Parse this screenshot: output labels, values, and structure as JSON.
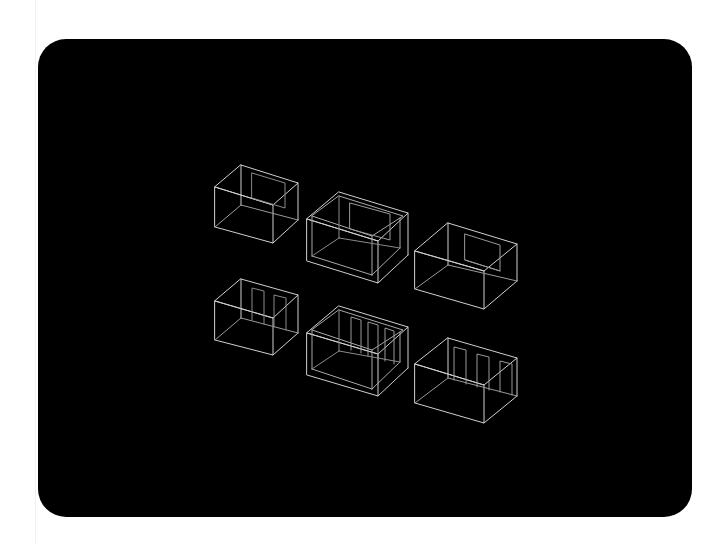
{
  "canvas": {
    "background": "#ffffff",
    "panel_color": "#000000",
    "line_color": "#cfcfcf",
    "dim_line_color": "#8a8a8a"
  },
  "scene": {
    "description": "Six isometric wireframe room boxes arranged in a 2x3 grid",
    "rows": [
      {
        "items": [
          {
            "name": "room-1",
            "openings": "single window on back wall",
            "walls": "single"
          },
          {
            "name": "room-2",
            "openings": "single window on back wall",
            "walls": "double"
          },
          {
            "name": "room-3",
            "openings": "single window on back wall",
            "walls": "single"
          }
        ]
      },
      {
        "items": [
          {
            "name": "room-4",
            "openings": "two doors on back wall",
            "walls": "single"
          },
          {
            "name": "room-5",
            "openings": "three doors on back wall",
            "walls": "double"
          },
          {
            "name": "room-6",
            "openings": "three doors on back wall",
            "walls": "single"
          }
        ]
      }
    ]
  }
}
